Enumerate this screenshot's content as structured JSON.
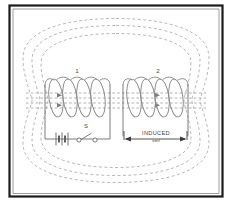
{
  "figure": {
    "background_color": "#ffffff",
    "frame_color": "#1b1b1b",
    "fieldline_color": "#9a9a9a",
    "wire_color": "#6d6d6d",
    "coil_color": "#8a8a8a"
  },
  "labels": {
    "coil_primary": "1",
    "coil_secondary": "2",
    "switch": "S",
    "induced_main": "INDUCED",
    "induced_sub": "emf"
  },
  "components": {
    "battery_name": "battery-symbol",
    "switch_name": "switch-symbol",
    "primary_coil_name": "primary-coil",
    "secondary_coil_name": "secondary-coil",
    "field_lines_name": "magnetic-field-lines",
    "emf_span_name": "induced-emf-span"
  },
  "geometry": {
    "width": 232,
    "height": 203,
    "primary_turns": 4,
    "secondary_turns": 4,
    "field_loop_count": 3,
    "core_line_count": 4
  }
}
